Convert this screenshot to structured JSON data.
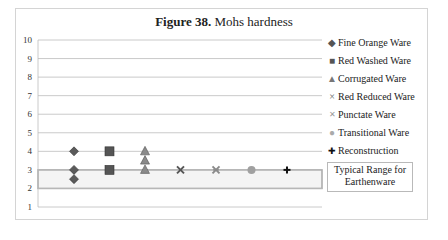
{
  "chart_data": {
    "type": "scatter",
    "title": "Figure 38. Mohs hardness",
    "title_bold_part": "Figure  38.",
    "title_rest": " Mohs hardness",
    "xlabel": "",
    "ylabel": "",
    "ylim": [
      1,
      10
    ],
    "yticks": [
      "10",
      "9",
      "8",
      "7",
      "6",
      "5",
      "4",
      "3",
      "2",
      "1"
    ],
    "grid": true,
    "legend_position": "right",
    "series": [
      {
        "name": "Fine Orange Ware",
        "marker": "diamond",
        "color": "#5a5a5a",
        "x": 1,
        "values": [
          4,
          3,
          2.5
        ]
      },
      {
        "name": "Red Washed Ware",
        "marker": "square",
        "color": "#555555",
        "x": 2,
        "values": [
          4,
          3
        ]
      },
      {
        "name": "Corrugated Ware",
        "marker": "triangle",
        "color": "#8a8a8a",
        "x": 3,
        "values": [
          4,
          3.5,
          3
        ]
      },
      {
        "name": "Red Reduced Ware",
        "marker": "x",
        "color": "#555555",
        "x": 4,
        "values": [
          3
        ]
      },
      {
        "name": "Punctate Ware",
        "marker": "star-x",
        "color": "#8a8a8a",
        "x": 5,
        "values": [
          3
        ]
      },
      {
        "name": "Transitional Ware",
        "marker": "circle",
        "color": "#a0a0a0",
        "x": 6,
        "values": [
          3
        ]
      },
      {
        "name": "Reconstruction",
        "marker": "plus",
        "color": "#111111",
        "x": 7,
        "values": [
          3
        ]
      }
    ],
    "annotations": [
      {
        "type": "band",
        "label": "Typical Range for Earthenware",
        "y_from": 2,
        "y_to": 3
      }
    ]
  },
  "legend": {
    "items": [
      {
        "symbol": "◆",
        "label": "Fine Orange Ware"
      },
      {
        "symbol": "■",
        "label": "Red Washed Ware"
      },
      {
        "symbol": "▲",
        "label": "Corrugated Ware"
      },
      {
        "symbol": "×",
        "label": "Red Reduced Ware"
      },
      {
        "symbol": "✕",
        "label": "Punctate Ware"
      },
      {
        "symbol": "●",
        "label": "Transitional Ware"
      },
      {
        "symbol": "✚",
        "label": "Reconstruction"
      }
    ],
    "range_label_line1": "Typical Range for",
    "range_label_line2": "Earthenware"
  }
}
